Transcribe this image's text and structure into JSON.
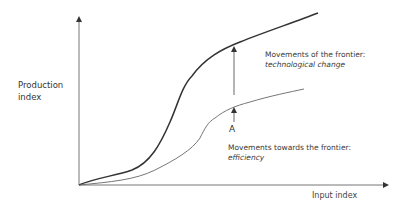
{
  "diagram": {
    "axes": {
      "y_label_line1": "Production",
      "y_label_line2": "index",
      "x_label": "Input index"
    },
    "curves": [
      {
        "name": "production frontier (after technological change)",
        "style": "thick dark",
        "color": "#333333"
      },
      {
        "name": "production frontier (before)",
        "style": "thin",
        "color": "#555555"
      }
    ],
    "annotations": {
      "tech_change_title": "Movements of the frontier:",
      "tech_change_subtitle": "technological change",
      "efficiency_title": "Movements towards the frontier:",
      "efficiency_subtitle": "efficiency",
      "point_label": "A"
    },
    "colors": {
      "axis": "#555555",
      "upper_curve": "#333333",
      "lower_curve": "#666666",
      "text": "#3a3a3a"
    }
  }
}
